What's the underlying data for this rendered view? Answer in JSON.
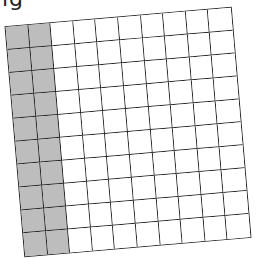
{
  "header": {
    "fragment_text": "ig"
  },
  "grid": {
    "rows": 10,
    "cols": 10,
    "shaded_columns": 2,
    "shaded_cells": 20,
    "total_cells": 100,
    "shaded_color": "#bdbdbd",
    "line_color": "#222222",
    "rotation_deg": -4.9
  }
}
